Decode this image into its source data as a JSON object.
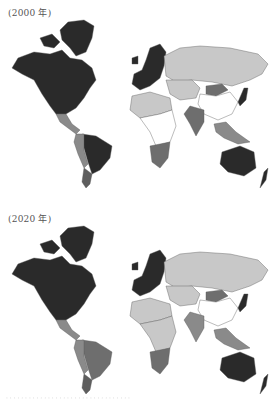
{
  "figure": {
    "panels": [
      {
        "label": "(2000 年)",
        "year": 2000,
        "shades": {
          "north_america": "#2a2a2a",
          "greenland": "#2a2a2a",
          "central_america": "#8a8a8a",
          "south_america_brazil": "#2a2a2a",
          "south_america_west": "#8a8a8a",
          "south_america_south": "#5e5e5e",
          "europe": "#2a2a2a",
          "russia": "#c8c8c8",
          "central_asia": "#c8c8c8",
          "mongolia": "#6e6e6e",
          "china": "#ffffff",
          "india": "#6e6e6e",
          "japan": "#2a2a2a",
          "southeast_asia": "#8a8a8a",
          "africa_north": "#c8c8c8",
          "africa_central": "#ffffff",
          "africa_south": "#6e6e6e",
          "australia": "#2a2a2a",
          "new_zealand": "#2a2a2a"
        }
      },
      {
        "label": "(2020 年)",
        "year": 2020,
        "shades": {
          "north_america": "#2a2a2a",
          "greenland": "#2a2a2a",
          "central_america": "#8a8a8a",
          "south_america_brazil": "#6e6e6e",
          "south_america_west": "#8a8a8a",
          "south_america_south": "#5e5e5e",
          "europe": "#2a2a2a",
          "russia": "#c8c8c8",
          "central_asia": "#c8c8c8",
          "mongolia": "#6e6e6e",
          "china": "#ffffff",
          "india": "#8a8a8a",
          "japan": "#2a2a2a",
          "southeast_asia": "#8a8a8a",
          "africa_north": "#c8c8c8",
          "africa_central": "#c8c8c8",
          "africa_south": "#6e6e6e",
          "australia": "#2a2a2a",
          "new_zealand": "#2a2a2a"
        }
      }
    ],
    "caption": "· · · · · · · · · · · · · · · · · · · · · · · · · · · · · · · · ·"
  }
}
